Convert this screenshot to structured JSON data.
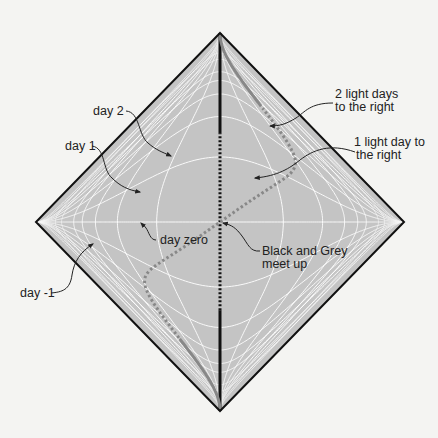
{
  "diagram": {
    "type": "penrose-diagram",
    "colors": {
      "background": "#f4f4f2",
      "diamond_fill": "#c4c4c4",
      "diamond_edge": "#111111",
      "grid": "#ffffff",
      "black_worldline": "#111111",
      "grey_worldline": "#888888",
      "annotation_text": "#222222"
    },
    "grid_times": [
      -3,
      -2,
      -1,
      0,
      1,
      2,
      3
    ],
    "grid_positions": [
      -3,
      -2,
      -1,
      0,
      1,
      2,
      3
    ],
    "worldlines": [
      {
        "name": "Black",
        "description": "stationary at x = 0"
      },
      {
        "name": "Grey",
        "description": "moves right and back; meets Black at day zero"
      }
    ],
    "labels": {
      "day2": "day 2",
      "day1": "day 1",
      "day_zero": "day zero",
      "day_minus1": "day -1",
      "two_light_days_line1": "2 light days",
      "two_light_days_line2": "to the right",
      "one_light_day_line1": "1 light day to",
      "one_light_day_line2": "the right",
      "meet_line1": "Black and Grey",
      "meet_line2": "meet up"
    }
  }
}
